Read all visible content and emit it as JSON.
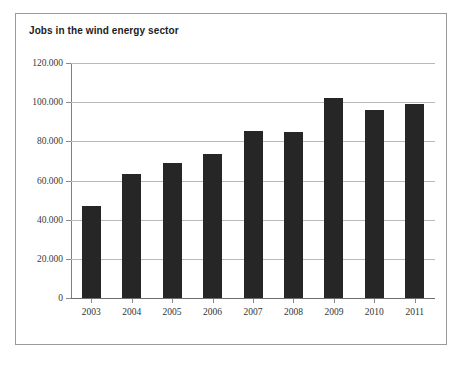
{
  "chart_data": {
    "type": "bar",
    "title": "Jobs in the wind energy sector",
    "xlabel": "",
    "ylabel": "",
    "categories": [
      "2003",
      "2004",
      "2005",
      "2006",
      "2007",
      "2008",
      "2009",
      "2010",
      "2011"
    ],
    "values": [
      47000,
      63500,
      69000,
      73500,
      85500,
      85000,
      102000,
      96000,
      99000
    ],
    "ylim": [
      0,
      120000
    ],
    "ytick_values": [
      0,
      20000,
      40000,
      60000,
      80000,
      100000,
      120000
    ],
    "ytick_labels": [
      "0",
      "20.000",
      "40.000",
      "60.000",
      "80.000",
      "100.000",
      "120.000"
    ],
    "grid": true,
    "legend": null,
    "series_color": "#262626"
  },
  "colors": {
    "bar": "#262626",
    "grid": "#b9b9b9",
    "frame_border": "#9a9a9a",
    "background": "#ffffff",
    "text": "#333333"
  }
}
